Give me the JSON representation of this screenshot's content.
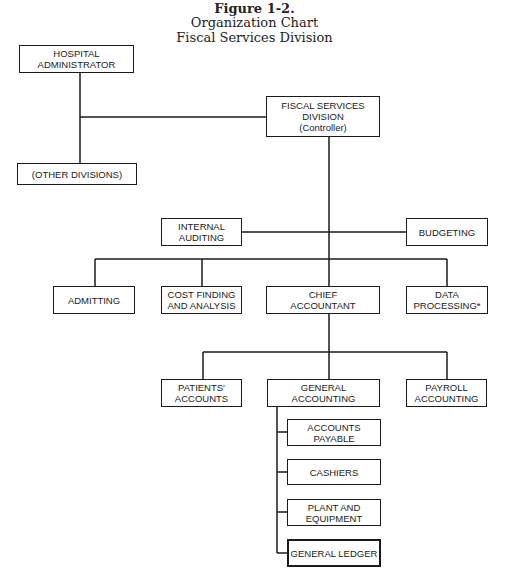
{
  "title": {
    "figure": "Figure 1-2.",
    "line1": "Organization Chart",
    "line2": "Fiscal Services Division"
  },
  "nodes": {
    "hospital_administrator": "HOSPITAL\nADMINISTRATOR",
    "other_divisions": "(OTHER DIVISIONS)",
    "fiscal_services": "FISCAL SERVICES\nDIVISION\n(Controller)",
    "internal_auditing": "INTERNAL\nAUDITING",
    "budgeting": "BUDGETING",
    "admitting": "ADMITTING",
    "cost_finding": "COST FINDING\nAND ANALYSIS",
    "chief_accountant": "CHIEF\nACCOUNTANT",
    "data_processing": "DATA\nPROCESSING*",
    "patients_accounts": "PATIENTS'\nACCOUNTS",
    "general_accounting": "GENERAL\nACCOUNTING",
    "payroll_accounting": "PAYROLL\nACCOUNTING",
    "accounts_payable": "ACCOUNTS\nPAYABLE",
    "cashiers": "CASHIERS",
    "plant_equipment": "PLANT AND\nEQUIPMENT",
    "general_ledger": "GENERAL LEDGER"
  },
  "hierarchy": {
    "HOSPITAL ADMINISTRATOR": [
      "FISCAL SERVICES DIVISION (Controller)",
      "(OTHER DIVISIONS)"
    ],
    "FISCAL SERVICES DIVISION (Controller)": [
      "INTERNAL AUDITING",
      "BUDGETING",
      "ADMITTING",
      "COST FINDING AND ANALYSIS",
      "CHIEF ACCOUNTANT",
      "DATA PROCESSING*"
    ],
    "CHIEF ACCOUNTANT": [
      "PATIENTS' ACCOUNTS",
      "GENERAL ACCOUNTING",
      "PAYROLL ACCOUNTING"
    ],
    "GENERAL ACCOUNTING": [
      "ACCOUNTS PAYABLE",
      "CASHIERS",
      "PLANT AND EQUIPMENT",
      "GENERAL LEDGER"
    ]
  }
}
